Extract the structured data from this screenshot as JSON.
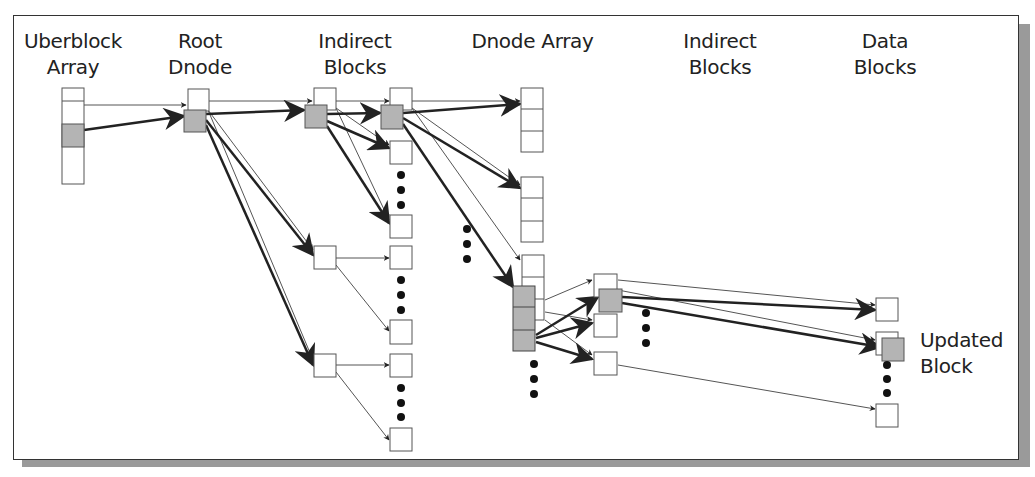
{
  "diagram": {
    "columns": [
      {
        "id": "uberblock",
        "line1": "Uberblock",
        "line2": "Array"
      },
      {
        "id": "root-dnode",
        "line1": "Root",
        "line2": "Dnode"
      },
      {
        "id": "indirect-1",
        "line1": "Indirect",
        "line2": "Blocks"
      },
      {
        "id": "dnode-array",
        "line1": "Dnode Array",
        "line2": ""
      },
      {
        "id": "indirect-2",
        "line1": "Indirect",
        "line2": "Blocks"
      },
      {
        "id": "data-blocks",
        "line1": "Data",
        "line2": "Blocks"
      }
    ],
    "annotation": {
      "line1": "Updated",
      "line2": "Block"
    },
    "colors": {
      "box_fill": "#ffffff",
      "updated_fill": "#b4b4b4",
      "stroke": "#555555",
      "arrow": "#222222",
      "shadow": "#9a9a9a"
    }
  }
}
